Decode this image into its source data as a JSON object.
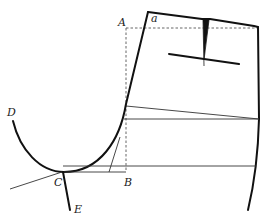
{
  "diagram": {
    "labels": {
      "A": "A",
      "a": "a",
      "B": "B",
      "C": "C",
      "D": "D",
      "E": "E"
    },
    "colors": {
      "outline": "#111111",
      "construction": "#333333",
      "guide": "#555555",
      "background": "#ffffff"
    }
  }
}
